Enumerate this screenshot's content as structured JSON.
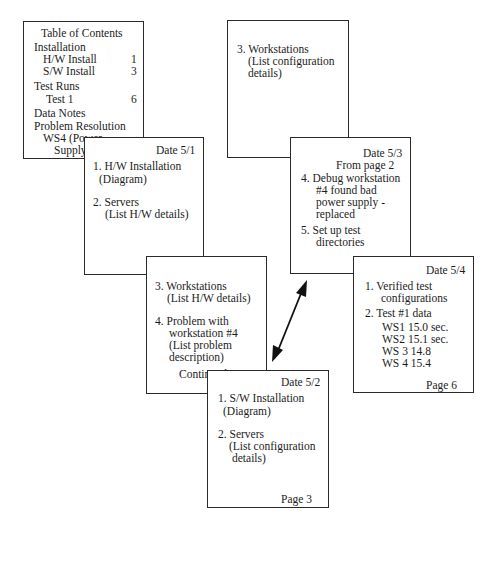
{
  "toc": {
    "title": "Table of Contents",
    "sections": [
      {
        "label": "Installation"
      },
      {
        "label": "H/W Install",
        "page": "1"
      },
      {
        "label": "S/W Install",
        "page": "3"
      },
      {
        "label": "Test Runs"
      },
      {
        "label": "Test 1",
        "page": "6"
      },
      {
        "label": "Data Notes"
      },
      {
        "label": "Problem Resolution"
      },
      {
        "label": "WS4 (Power",
        "label2": "Supply)",
        "page": "5"
      }
    ]
  },
  "pages": {
    "p1": {
      "date": "Date 5/1",
      "items": [
        "1.  H/W Installation",
        "(Diagram)",
        "2.  Servers",
        "(List H/W details)"
      ],
      "footer": "Page 1"
    },
    "p2": {
      "items": [
        "3.  Workstations",
        "(List H/W details)",
        "4.  Problem with",
        "workstation #4",
        "(List problem",
        "description)"
      ],
      "continued": "Continued on 5",
      "footer": "Page 2"
    },
    "p3": {
      "date": "Date 5/2",
      "items": [
        "1.  S/W Installation",
        "(Diagram)",
        "2.  Servers",
        "(List configuration",
        "details)"
      ],
      "footer": "Page 3"
    },
    "p4": {
      "items": [
        "3.  Workstations",
        "(List configuration",
        "details)"
      ],
      "footer": "Page 4"
    },
    "p5": {
      "date": "Date 5/3",
      "from": "From page 2",
      "items": [
        "4.  Debug workstation",
        "#4  found bad",
        "power supply -",
        "replaced",
        "5.  Set up test",
        "directories"
      ],
      "footer": "Page 5"
    },
    "p6": {
      "date": "Date 5/4",
      "items": [
        "1.  Verified test",
        "configurations",
        "2.  Test #1 data",
        "WS1 15.0 sec.",
        "WS2 15.1 sec.",
        "WS 3 14.8",
        "WS 4 15.4"
      ],
      "footer": "Page 6"
    }
  },
  "connector": {
    "type": "double-arrow",
    "from": "Page 2",
    "to": "Page 5",
    "color": "#111111"
  }
}
